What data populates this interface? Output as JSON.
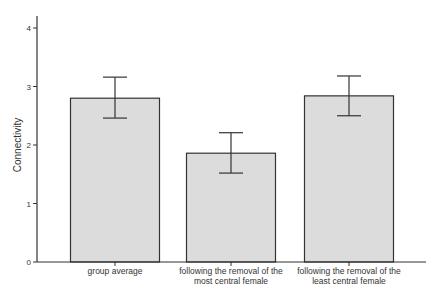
{
  "chart_data": {
    "type": "bar",
    "title": "",
    "xlabel": "",
    "ylabel": "Connectivity",
    "ylim": [
      0,
      4.3
    ],
    "yticks": [
      0,
      1,
      2,
      3,
      4
    ],
    "grid": false,
    "legend": null,
    "categories": [
      [
        "group average"
      ],
      [
        "following the removal of the",
        "most central female"
      ],
      [
        "following the removal of the",
        "least central female"
      ]
    ],
    "values": [
      2.8,
      1.86,
      2.84
    ],
    "error_bars": [
      {
        "low": 2.46,
        "high": 3.16
      },
      {
        "low": 1.52,
        "high": 2.21
      },
      {
        "low": 2.5,
        "high": 3.18
      }
    ],
    "colors": {
      "bar_fill": "#dcdcdc",
      "bar_stroke": "#333333",
      "axis": "#333333",
      "error_bar": "#333333"
    }
  }
}
